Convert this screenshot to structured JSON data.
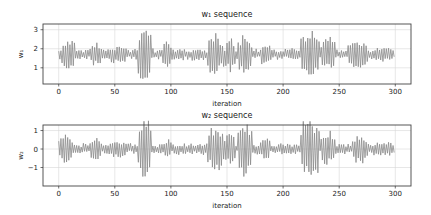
{
  "figure": {
    "width": 431,
    "height": 215,
    "background": "#ffffff"
  },
  "chart_data": [
    {
      "type": "line",
      "title": "w₁ sequence",
      "xlabel": "iteration",
      "ylabel": "w₁",
      "xlim": [
        -14,
        314
      ],
      "ylim": [
        0.15,
        3.3
      ],
      "xticks": [
        0,
        50,
        100,
        150,
        200,
        250,
        300
      ],
      "yticks": [
        1,
        2,
        3
      ],
      "grid": true,
      "legend": null,
      "series": [
        {
          "name": "w1",
          "color": "#8a8a8a",
          "n_points": 300,
          "baseline": 1.7,
          "base_noise": 0.25,
          "bursts": [
            {
              "start": 3,
              "end": 14,
              "amplitude": 0.85
            },
            {
              "start": 28,
              "end": 38,
              "amplitude": 0.65
            },
            {
              "start": 45,
              "end": 60,
              "amplitude": 0.45
            },
            {
              "start": 71,
              "end": 82,
              "amplitude": 1.45
            },
            {
              "start": 93,
              "end": 100,
              "amplitude": 0.7
            },
            {
              "start": 133,
              "end": 147,
              "amplitude": 1.05
            },
            {
              "start": 149,
              "end": 157,
              "amplitude": 0.95
            },
            {
              "start": 160,
              "end": 172,
              "amplitude": 1.1
            },
            {
              "start": 180,
              "end": 188,
              "amplitude": 0.55
            },
            {
              "start": 216,
              "end": 232,
              "amplitude": 1.4
            },
            {
              "start": 234,
              "end": 246,
              "amplitude": 0.95
            },
            {
              "start": 258,
              "end": 275,
              "amplitude": 0.7
            },
            {
              "start": 280,
              "end": 298,
              "amplitude": 0.35
            }
          ]
        }
      ]
    },
    {
      "type": "line",
      "title": "w₂ sequence",
      "xlabel": "iteration",
      "ylabel": "w₂",
      "xlim": [
        -14,
        314
      ],
      "ylim": [
        -2.0,
        1.3
      ],
      "xticks": [
        0,
        50,
        100,
        150,
        200,
        250,
        300
      ],
      "yticks": [
        -1,
        0,
        1
      ],
      "grid": true,
      "legend": null,
      "series": [
        {
          "name": "w2",
          "color": "#8a8a8a",
          "n_points": 300,
          "baseline": 0.0,
          "base_noise": 0.25,
          "bursts": [
            {
              "start": 0,
              "end": 12,
              "amplitude": 0.8
            },
            {
              "start": 28,
              "end": 38,
              "amplitude": 0.6
            },
            {
              "start": 45,
              "end": 60,
              "amplitude": 0.45
            },
            {
              "start": 71,
              "end": 82,
              "amplitude": 1.7
            },
            {
              "start": 95,
              "end": 100,
              "amplitude": 0.55
            },
            {
              "start": 133,
              "end": 147,
              "amplitude": 1.2
            },
            {
              "start": 148,
              "end": 157,
              "amplitude": 0.9
            },
            {
              "start": 160,
              "end": 172,
              "amplitude": 1.45
            },
            {
              "start": 180,
              "end": 188,
              "amplitude": 0.6
            },
            {
              "start": 216,
              "end": 232,
              "amplitude": 1.75
            },
            {
              "start": 234,
              "end": 246,
              "amplitude": 0.95
            },
            {
              "start": 262,
              "end": 275,
              "amplitude": 0.8
            },
            {
              "start": 280,
              "end": 298,
              "amplitude": 0.4
            }
          ]
        }
      ]
    }
  ],
  "layout": {
    "axes": [
      {
        "left": 43,
        "top": 24,
        "right": 411,
        "bottom": 84,
        "title_y": 17,
        "xlabel_y": 106
      },
      {
        "left": 43,
        "top": 125,
        "right": 411,
        "bottom": 186,
        "title_y": 118,
        "xlabel_y": 208
      }
    ],
    "frame_color": "#444444",
    "grid_color": "#d6d6d6"
  }
}
